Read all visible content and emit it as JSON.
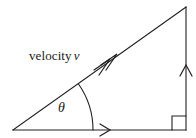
{
  "figure": {
    "background_color": "#ffffff",
    "stroke_color": "#231f20",
    "text_color": "#1a1a1a",
    "width": 196,
    "height": 138,
    "labels": {
      "velocity_word": "velocity",
      "velocity_symbol": "v",
      "angle_symbol": "θ"
    },
    "geometry": {
      "left_vertex": [
        13,
        130
      ],
      "right_vertex": [
        186,
        130
      ],
      "apex": [
        186,
        7
      ],
      "base_length_px": 173,
      "height_px": 123,
      "angle_degrees": 35
    },
    "markers": {
      "right_angle_square_size": 14,
      "angle_arc_radius": 80,
      "base_arrow_position": [
        108,
        130
      ],
      "vertical_arrow_position": [
        186,
        66
      ],
      "hypotenuse_arrow_position": [
        112,
        58
      ],
      "hypotenuse_arrowhead_count": 2
    }
  }
}
